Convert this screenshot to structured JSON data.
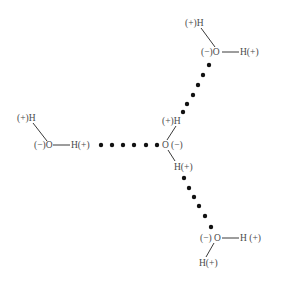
{
  "diagram": {
    "type": "hydrogen-bonding-of-water-molecules",
    "colors": {
      "text": "#4a4a4a",
      "bond_line": "#3a3a3a",
      "hbond_dot": "#111111",
      "background": "#ffffff"
    },
    "molecules": [
      {
        "id": "top-right-water",
        "labels": [
          {
            "id": "h1",
            "text": "(+)H",
            "x": 185,
            "y": 23
          },
          {
            "id": "o",
            "text": "(−)O",
            "x": 201,
            "y": 52
          },
          {
            "id": "h2",
            "text": "H(+)",
            "x": 240,
            "y": 52
          }
        ],
        "bonds": [
          {
            "x1": 201,
            "y1": 28,
            "x2": 215,
            "y2": 47
          },
          {
            "x1": 222,
            "y1": 52,
            "x2": 239,
            "y2": 52
          }
        ]
      },
      {
        "id": "left-water",
        "labels": [
          {
            "id": "h1",
            "text": "(+)H",
            "x": 17,
            "y": 118
          },
          {
            "id": "o",
            "text": "(−)O",
            "x": 34,
            "y": 145
          },
          {
            "id": "h2",
            "text": "H(+)",
            "x": 71,
            "y": 145
          }
        ],
        "bonds": [
          {
            "x1": 33,
            "y1": 123,
            "x2": 47,
            "y2": 141
          },
          {
            "x1": 53,
            "y1": 145,
            "x2": 70,
            "y2": 145
          }
        ]
      },
      {
        "id": "center-water",
        "labels": [
          {
            "id": "h1",
            "text": "(+)H",
            "x": 162,
            "y": 121
          },
          {
            "id": "o",
            "text": "O",
            "x": 162,
            "y": 145
          },
          {
            "id": "charge",
            "text": "(−)",
            "x": 171,
            "y": 145
          },
          {
            "id": "h2",
            "text": "H(+)",
            "x": 174,
            "y": 167
          }
        ],
        "bonds": [
          {
            "x1": 167,
            "y1": 140,
            "x2": 176,
            "y2": 126
          },
          {
            "x1": 168,
            "y1": 150,
            "x2": 175,
            "y2": 161
          }
        ]
      },
      {
        "id": "bottom-right-water",
        "labels": [
          {
            "id": "charge",
            "text": "(−)",
            "x": 200,
            "y": 238
          },
          {
            "id": "o",
            "text": "O",
            "x": 214,
            "y": 238
          },
          {
            "id": "h1",
            "text": "H (+)",
            "x": 240,
            "y": 238
          },
          {
            "id": "h2",
            "text": "H(+)",
            "x": 199,
            "y": 263
          }
        ],
        "bonds": [
          {
            "x1": 222,
            "y1": 238,
            "x2": 239,
            "y2": 238
          },
          {
            "x1": 214,
            "y1": 243,
            "x2": 206,
            "y2": 257
          }
        ]
      }
    ],
    "hydrogen_bonds": [
      {
        "id": "hbond-center-to-top-right",
        "dots": [
          [
            209,
            65
          ],
          [
            203,
            75
          ],
          [
            198,
            85
          ],
          [
            193,
            95
          ],
          [
            187,
            104
          ],
          [
            183,
            112
          ]
        ]
      },
      {
        "id": "hbond-left-to-center",
        "dots": [
          [
            101,
            145
          ],
          [
            112,
            145
          ],
          [
            123,
            145
          ],
          [
            134,
            145
          ],
          [
            146,
            145
          ],
          [
            157,
            145
          ]
        ]
      },
      {
        "id": "hbond-center-to-bottom-right",
        "dots": [
          [
            184,
            178
          ],
          [
            189,
            188
          ],
          [
            194,
            197
          ],
          [
            199,
            206
          ],
          [
            205,
            216
          ],
          [
            211,
            227
          ]
        ]
      }
    ]
  }
}
